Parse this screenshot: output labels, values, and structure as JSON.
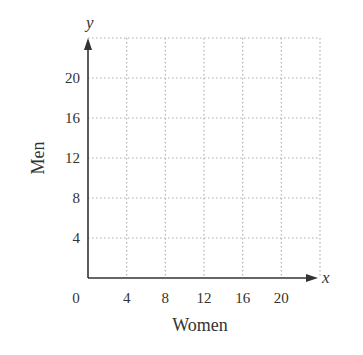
{
  "chart_data": {
    "type": "scatter",
    "title": "",
    "xlabel": "Women",
    "ylabel": "Men",
    "x_axis_symbol": "x",
    "y_axis_symbol": "y",
    "origin_label": "0",
    "x_ticks": [
      "4",
      "8",
      "12",
      "16",
      "20"
    ],
    "y_ticks": [
      "4",
      "8",
      "12",
      "16",
      "20"
    ],
    "xlim": [
      0,
      24
    ],
    "ylim": [
      0,
      24
    ],
    "grid": true,
    "grid_style": "dotted",
    "series": [],
    "legend": null
  },
  "colors": {
    "axis": "#333333",
    "grid": "#b0b0b0",
    "text": "#333333"
  }
}
